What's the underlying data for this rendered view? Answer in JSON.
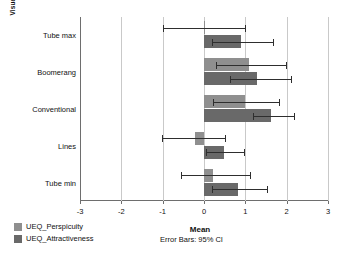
{
  "chart_data": {
    "type": "bar",
    "orientation": "horizontal",
    "title": "",
    "xlabel": "Mean",
    "ylabel": "Visualization",
    "xlim": [
      -3,
      3
    ],
    "xticks": [
      -3,
      -2,
      -1,
      0,
      1,
      2,
      3
    ],
    "xtick_labels": [
      "-3",
      "-2",
      "-1",
      "0",
      "1",
      "2",
      "3"
    ],
    "grid": true,
    "grid_axis": "x",
    "legend_position": "bottom-left",
    "annotation": "Error Bars: 95% CI",
    "categories": [
      "Tube max",
      "Boomerang",
      "Conventional",
      "Lines",
      "Tube min"
    ],
    "series": [
      {
        "name": "UEQ_Perspicuity",
        "color": "#8f8f8f",
        "values": [
          0.02,
          1.1,
          1.0,
          -0.22,
          0.22
        ],
        "ci_low": [
          -1.0,
          0.3,
          0.22,
          -1.02,
          -0.55
        ],
        "ci_high": [
          1.0,
          1.98,
          1.82,
          0.52,
          1.12
        ]
      },
      {
        "name": "UEQ_Attractiveness",
        "color": "#696969",
        "values": [
          0.9,
          1.28,
          1.63,
          0.48,
          0.82
        ],
        "ci_low": [
          0.2,
          0.62,
          1.18,
          0.04,
          0.2
        ],
        "ci_high": [
          1.68,
          2.1,
          2.18,
          0.96,
          1.52
        ]
      }
    ]
  },
  "legend": {
    "items": [
      {
        "label": "UEQ_Perspicuity",
        "swatch": "perspicuity"
      },
      {
        "label": "UEQ_Attractiveness",
        "swatch": "attractiveness"
      }
    ]
  },
  "notes": {
    "error_bars": "Error Bars: 95% CI"
  }
}
